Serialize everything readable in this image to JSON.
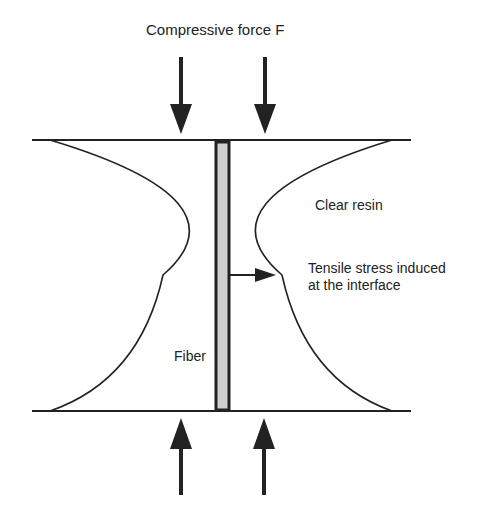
{
  "diagram": {
    "title_label": "Compressive force F",
    "labels": {
      "resin": "Clear resin",
      "stress_line1": "Tensile stress induced",
      "stress_line2": "at the interface",
      "fiber": "Fiber"
    },
    "colors": {
      "line": "#222222",
      "fiber_fill": "#d0d0d0",
      "background": "#ffffff"
    },
    "arrows": [
      {
        "name": "compressive-force-top-left",
        "direction": "down"
      },
      {
        "name": "compressive-force-top-right",
        "direction": "down"
      },
      {
        "name": "compressive-force-bottom-left",
        "direction": "up"
      },
      {
        "name": "compressive-force-bottom-right",
        "direction": "up"
      },
      {
        "name": "tensile-stress",
        "direction": "right"
      }
    ]
  }
}
